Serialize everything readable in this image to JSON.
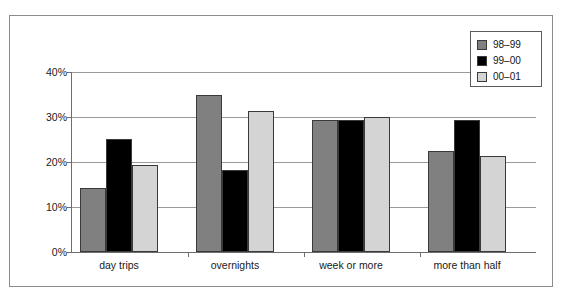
{
  "chart_data": {
    "type": "bar",
    "title": "",
    "subtitle": "",
    "xlabel": "",
    "ylabel": "",
    "categories": [
      "day trips",
      "overnights",
      "week or more",
      "more than half"
    ],
    "series": [
      {
        "name": "98–99",
        "color": "#808080",
        "values": [
          14.2,
          35.0,
          29.3,
          22.4
        ]
      },
      {
        "name": "99–00",
        "color": "#000000",
        "values": [
          25.1,
          18.2,
          29.4,
          29.4
        ]
      },
      {
        "name": "00–01",
        "color": "#d4d4d4",
        "values": [
          19.3,
          31.3,
          30.1,
          21.3
        ]
      }
    ],
    "ylim": [
      0,
      40
    ],
    "yticks": [
      0,
      10,
      20,
      30,
      40
    ],
    "ytick_labels": [
      "0%",
      "10%",
      "20%",
      "30%",
      "40%"
    ],
    "grid": true,
    "grid_axis": "y",
    "legend_position": "top-right",
    "value_format": "percent"
  },
  "legend": {
    "entries": [
      {
        "label": "98–99",
        "swatch": "legend-swatch-98-99"
      },
      {
        "label": "99–00",
        "swatch": "legend-swatch-99-00"
      },
      {
        "label": "00–01",
        "swatch": "legend-swatch-00-01"
      }
    ]
  },
  "colors": {
    "series_1": "#808080",
    "series_2": "#000000",
    "series_3": "#d4d4d4",
    "axis": "#6e6e6e",
    "grid": "#9a9a9a",
    "frame": "#8c8c8c",
    "text": "#1a1a1a",
    "background": "#ffffff"
  }
}
